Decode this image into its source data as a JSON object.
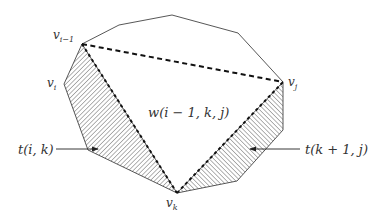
{
  "diagram": {
    "type": "polygon-triangulation",
    "vertices": {
      "v_im1": {
        "label": "v_{i-1}",
        "main": "v",
        "sub": "i−1",
        "x": 82,
        "y": 44
      },
      "v_i": {
        "label": "v_i",
        "main": "v",
        "sub": "i",
        "x": 64,
        "y": 84
      },
      "v_j": {
        "label": "v_j",
        "main": "v",
        "sub": "j",
        "x": 283,
        "y": 82
      },
      "v_k": {
        "label": "v_k",
        "main": "v",
        "sub": "k",
        "x": 177,
        "y": 193
      }
    },
    "regions": {
      "left": {
        "label": "t(i, k)",
        "hatch": "diagonal"
      },
      "center": {
        "label": "w(i − 1, k, j)"
      },
      "right": {
        "label": "t(k + 1, j)",
        "hatch": "diagonal-reverse"
      }
    },
    "colors": {
      "stroke": "#333333",
      "hatch": "#555555",
      "background": "#ffffff"
    }
  }
}
